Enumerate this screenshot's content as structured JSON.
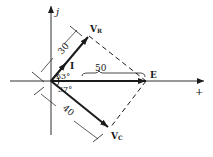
{
  "diagram": {
    "type": "phasor-diagram",
    "axes": {
      "imag_label": "j",
      "real_label": "+"
    },
    "phasors": [
      {
        "name": "V_R",
        "label_main": "V",
        "label_sub": "R",
        "magnitude": "30",
        "angle": "53°"
      },
      {
        "name": "E",
        "label_main": "E",
        "magnitude": "50"
      },
      {
        "name": "V_C",
        "label_main": "V",
        "label_sub": "C",
        "magnitude": "40",
        "angle": "37°"
      },
      {
        "name": "I",
        "label_main": "I"
      }
    ],
    "angle_labels": {
      "upper": "53°",
      "lower": "37°"
    },
    "dimension_labels": {
      "vr": "30",
      "e": "50",
      "vc": "40"
    },
    "colors": {
      "line": "#1a1a1a",
      "background": "#ffffff"
    }
  }
}
